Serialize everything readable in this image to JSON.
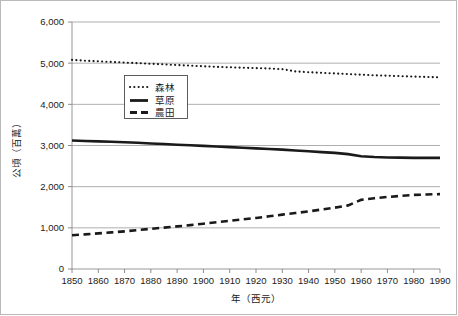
{
  "chart_data": {
    "type": "line",
    "title": "",
    "xlabel": "年（西元）",
    "ylabel": "公頃（百萬）",
    "xlim": [
      1850,
      1990
    ],
    "ylim": [
      0,
      6000
    ],
    "grid": true,
    "legend_position": "inside-upper-left",
    "x_ticks": [
      "1850",
      "1860",
      "1870",
      "1880",
      "1890",
      "1900",
      "1910",
      "1920",
      "1930",
      "1940",
      "1950",
      "1960",
      "1970",
      "1980",
      "1990"
    ],
    "y_ticks": [
      "0",
      "1,000",
      "2,000",
      "3,000",
      "4,000",
      "5,000",
      "6,000"
    ],
    "x": [
      1850,
      1855,
      1860,
      1865,
      1870,
      1875,
      1880,
      1885,
      1890,
      1895,
      1900,
      1905,
      1910,
      1915,
      1920,
      1925,
      1930,
      1935,
      1940,
      1945,
      1950,
      1955,
      1960,
      1965,
      1970,
      1975,
      1980,
      1985,
      1990
    ],
    "series": [
      {
        "name": "森林",
        "style": "dotted",
        "values": [
          5080,
          5060,
          5045,
          5030,
          5015,
          5000,
          4985,
          4970,
          4955,
          4940,
          4925,
          4910,
          4900,
          4890,
          4880,
          4870,
          4855,
          4800,
          4780,
          4765,
          4750,
          4735,
          4720,
          4705,
          4695,
          4685,
          4675,
          4665,
          4655
        ]
      },
      {
        "name": "草原",
        "style": "solid",
        "values": [
          3120,
          3110,
          3100,
          3090,
          3080,
          3065,
          3050,
          3035,
          3020,
          3005,
          2990,
          2975,
          2960,
          2945,
          2930,
          2915,
          2900,
          2880,
          2860,
          2840,
          2820,
          2790,
          2740,
          2720,
          2710,
          2705,
          2700,
          2700,
          2700
        ]
      },
      {
        "name": "農田",
        "style": "dashed",
        "values": [
          820,
          840,
          865,
          890,
          915,
          945,
          975,
          1005,
          1035,
          1065,
          1100,
          1135,
          1170,
          1205,
          1240,
          1280,
          1320,
          1360,
          1400,
          1445,
          1490,
          1545,
          1680,
          1720,
          1750,
          1775,
          1800,
          1810,
          1820
        ]
      }
    ]
  },
  "legend": {
    "items": [
      {
        "label": "森林",
        "swatch": "dotted-line-swatch"
      },
      {
        "label": "草原",
        "swatch": "solid-line-swatch"
      },
      {
        "label": "農田",
        "swatch": "dashed-line-swatch"
      }
    ]
  },
  "axes": {
    "y_title": "公頃（百萬）",
    "x_title": "年（西元）"
  }
}
